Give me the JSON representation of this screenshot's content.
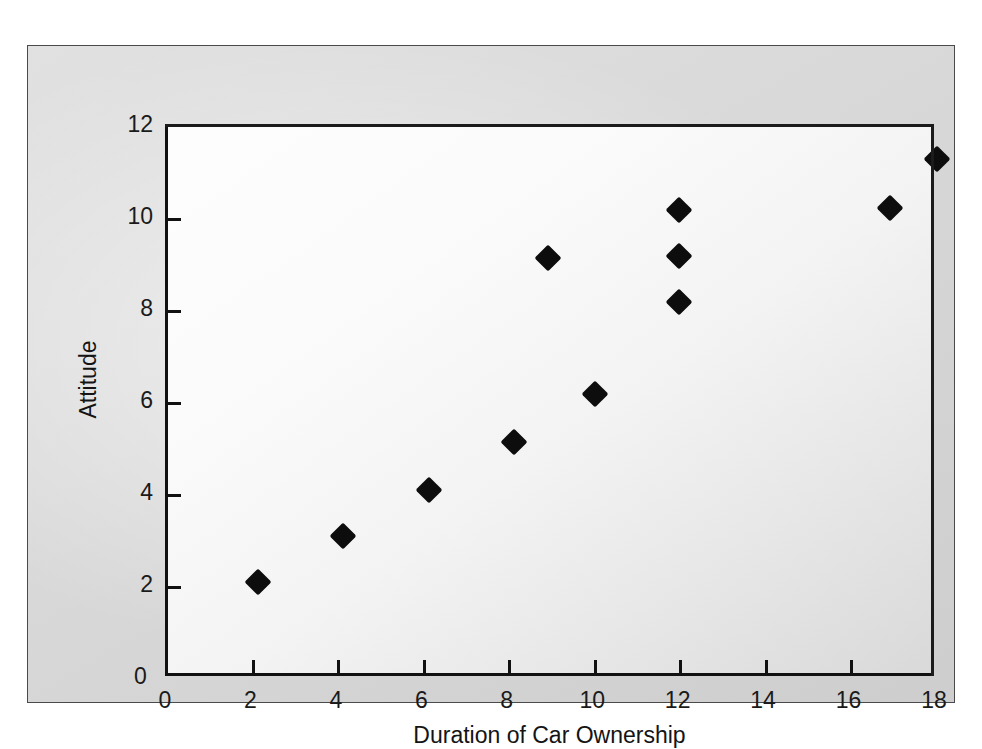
{
  "figure": {
    "background_color": "#d7d7d7",
    "plot_background_color": "#fbfbfb",
    "axis_color": "#111111",
    "marker_color": "#0d0d0d"
  },
  "chart_data": {
    "type": "scatter",
    "title": "",
    "xlabel": "Duration of Car Ownership",
    "ylabel": "Attitude",
    "xlim": [
      0,
      18
    ],
    "ylim": [
      0,
      12
    ],
    "xticks": [
      0,
      2,
      4,
      6,
      8,
      10,
      12,
      14,
      16,
      18
    ],
    "xtick_labels": [
      "0",
      "2",
      "4",
      "6",
      "8",
      "10",
      "12",
      "14",
      "16",
      "18"
    ],
    "yticks": [
      0,
      2,
      4,
      6,
      8,
      10,
      12
    ],
    "ytick_labels": [
      "0",
      "2",
      "4",
      "6",
      "8",
      "10",
      "12"
    ],
    "grid": false,
    "legend": null,
    "marker": "diamond",
    "series": [
      {
        "name": "Attitude vs Duration of Car Ownership",
        "points": [
          {
            "x": 2.1,
            "y": 2.1
          },
          {
            "x": 4.1,
            "y": 3.1
          },
          {
            "x": 6.1,
            "y": 4.1
          },
          {
            "x": 8.1,
            "y": 5.15
          },
          {
            "x": 8.9,
            "y": 9.15
          },
          {
            "x": 10.0,
            "y": 6.2
          },
          {
            "x": 11.95,
            "y": 8.2
          },
          {
            "x": 11.95,
            "y": 9.2
          },
          {
            "x": 11.95,
            "y": 10.2
          },
          {
            "x": 16.9,
            "y": 10.25
          },
          {
            "x": 18.0,
            "y": 11.3
          }
        ]
      }
    ]
  }
}
